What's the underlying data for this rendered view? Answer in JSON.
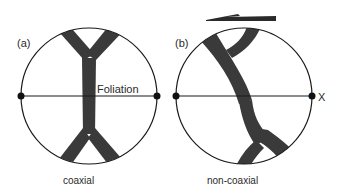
{
  "panels": [
    {
      "id": "a",
      "panel_label": "(a)",
      "caption": "coaxial",
      "line_label": "Foliation"
    },
    {
      "id": "b",
      "panel_label": "(b)",
      "caption": "non-coaxial",
      "line_label": "X",
      "shear_arrow_direction": "left"
    }
  ],
  "colors": {
    "vein_fill": "#3a3a3a",
    "outline": "#1a1a1a",
    "background": "#ffffff"
  }
}
